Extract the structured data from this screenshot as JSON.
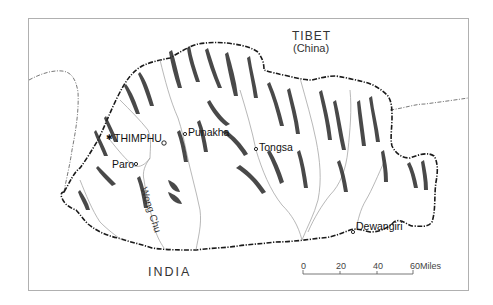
{
  "map": {
    "region": "Bhutan",
    "neighbors": {
      "north": {
        "name": "TIBET",
        "sub": "(China)"
      },
      "south": {
        "name": "INDIA"
      }
    },
    "cities": [
      {
        "name": "THIMPHU",
        "type": "capital"
      },
      {
        "name": "Punakha",
        "type": "town"
      },
      {
        "name": "Tongsa",
        "type": "town"
      },
      {
        "name": "Paro",
        "type": "town"
      },
      {
        "name": "Dewangiri",
        "type": "town"
      }
    ],
    "rivers": [
      {
        "name": "Wong Chu"
      }
    ],
    "scale": {
      "ticks": [
        "0",
        "20",
        "40",
        "60Miles"
      ],
      "unit": "Miles"
    },
    "colors": {
      "border": "#222222",
      "relief": "#333333",
      "river": "#9a9a9a",
      "frame": "#b0b0b0",
      "background": "#ffffff"
    }
  }
}
